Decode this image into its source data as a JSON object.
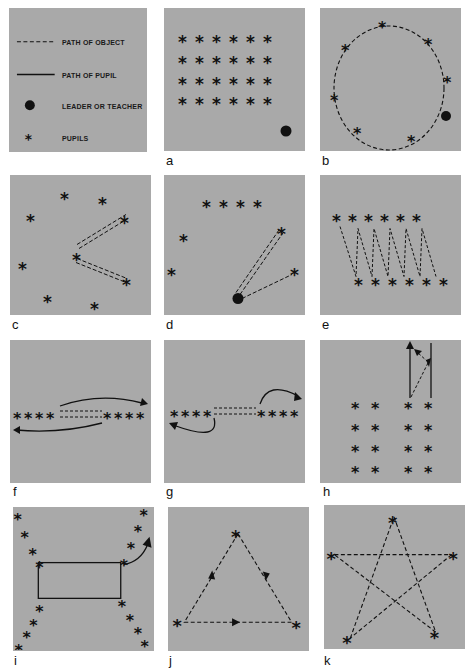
{
  "legend": {
    "items": [
      {
        "symbol": "dashed-line",
        "label": "PATH OF OBJECT"
      },
      {
        "symbol": "solid-line",
        "label": "PATH OF PUPIL"
      },
      {
        "symbol": "filled-circle",
        "label": "LEADER OR TEACHER"
      },
      {
        "symbol": "asterisk",
        "label": "PUPILS"
      }
    ]
  },
  "colors": {
    "panel": "#a9a9a9",
    "ink": "#111111",
    "background": "#ffffff"
  },
  "panels": [
    {
      "id": "a",
      "label": "a",
      "description": "Pupils in 4 rows of 6, leader at lower right"
    },
    {
      "id": "b",
      "label": "b",
      "description": "Pupils in a circle passing object, leader on circle"
    },
    {
      "id": "c",
      "label": "c",
      "description": "Scattered pupils, center pupil passes to two others"
    },
    {
      "id": "d",
      "label": "d",
      "description": "Leader passes to pupils in semicircle"
    },
    {
      "id": "e",
      "label": "e",
      "description": "Two staggered lines of 6 passing in zigzag"
    },
    {
      "id": "f",
      "label": "f",
      "description": "Two lines of 4 facing, pupils run around after passing"
    },
    {
      "id": "g",
      "label": "g",
      "description": "Two lines of 4 facing, pupils loop to back of own line"
    },
    {
      "id": "h",
      "label": "h",
      "description": "Two groups of 2x4 columns, run and pass relay"
    },
    {
      "id": "i",
      "label": "i",
      "description": "Four diagonal lines of 4 at corners of a rectangle"
    },
    {
      "id": "j",
      "label": "j",
      "description": "Three pupils in triangle passing clockwise"
    },
    {
      "id": "k",
      "label": "k",
      "description": "Five pupils in star passing pattern"
    }
  ]
}
